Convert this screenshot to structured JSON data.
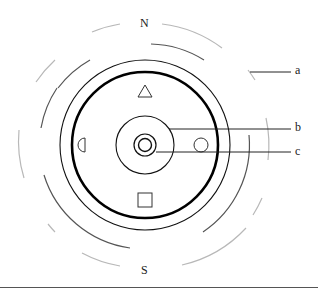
{
  "diagram": {
    "directions": {
      "north": "N",
      "south": "S"
    },
    "callouts": [
      {
        "id": "a",
        "label": "a",
        "target": "outer dashed ring"
      },
      {
        "id": "b",
        "label": "b",
        "target": "middle circle"
      },
      {
        "id": "c",
        "label": "c",
        "target": "central small circles"
      }
    ],
    "markers": [
      {
        "shape": "triangle",
        "position": "top"
      },
      {
        "shape": "half-circle",
        "position": "left"
      },
      {
        "shape": "circle",
        "position": "right"
      },
      {
        "shape": "square",
        "position": "bottom"
      }
    ],
    "rings": [
      {
        "name": "center-inner",
        "radius": 6
      },
      {
        "name": "center-outer",
        "radius": 11
      },
      {
        "name": "middle",
        "radius": 29
      },
      {
        "name": "thick",
        "radius": 74
      },
      {
        "name": "thin",
        "radius": 85
      },
      {
        "name": "dashed-inner",
        "radius": 105
      },
      {
        "name": "dashed-outer",
        "radius": 125
      }
    ],
    "colors": {
      "line": "#111111",
      "dashed_inner": "#555555",
      "dashed_outer": "#b5b5b5"
    }
  }
}
